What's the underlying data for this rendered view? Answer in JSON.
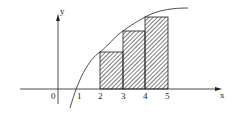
{
  "axes": {
    "x_label": "x",
    "y_label": "y",
    "origin_label": "0",
    "x_ticks": [
      "1",
      "2",
      "3",
      "4",
      "5"
    ]
  },
  "rectangles": [
    {
      "from": 2,
      "to": 3,
      "label": "rect-2-3"
    },
    {
      "from": 3,
      "to": 4,
      "label": "rect-3-4"
    },
    {
      "from": 4,
      "to": 5,
      "label": "rect-4-5"
    }
  ],
  "colors": {
    "stroke": "#222222",
    "hatch": "#333333",
    "background": "#ffffff"
  }
}
